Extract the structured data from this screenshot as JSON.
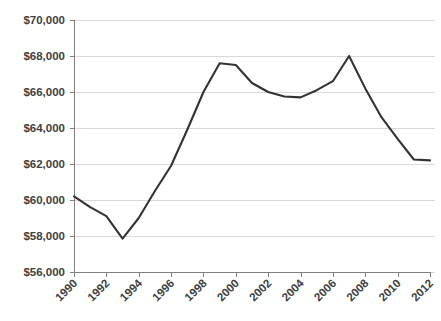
{
  "chart_data": {
    "type": "line",
    "title": "",
    "subtitle": "",
    "xlabel": "",
    "ylabel": "",
    "grid": true,
    "legend": false,
    "legend_position": "none",
    "line_color": "#333333",
    "grid_color": "#d9d9d9",
    "axis_color": "#808080",
    "text_color": "#404040",
    "xlim": [
      1990,
      2012
    ],
    "ylim": [
      56000,
      70000
    ],
    "y_tick_step": 2000,
    "x_tick_step": 2,
    "x_label_rotation": -45,
    "y_tick_labels": [
      "$70,000",
      "$68,000",
      "$66,000",
      "$64,000",
      "$62,000",
      "$60,000",
      "$58,000",
      "$56,000"
    ],
    "y_tick_values": [
      70000,
      68000,
      66000,
      64000,
      62000,
      60000,
      58000,
      56000
    ],
    "x_tick_labels": [
      "1990",
      "1992",
      "1994",
      "1996",
      "1998",
      "2000",
      "2002",
      "2004",
      "2006",
      "2008",
      "2010",
      "2012"
    ],
    "x_tick_values": [
      1990,
      1992,
      1994,
      1996,
      1998,
      2000,
      2002,
      2004,
      2006,
      2008,
      2010,
      2012
    ],
    "x": [
      1990,
      1991,
      1992,
      1993,
      1994,
      1995,
      1996,
      1997,
      1998,
      1999,
      2000,
      2001,
      2002,
      2003,
      2004,
      2005,
      2006,
      2007,
      2008,
      2009,
      2010,
      2011,
      2012
    ],
    "values": [
      60200,
      59600,
      59100,
      57850,
      59000,
      60500,
      61900,
      63900,
      66000,
      67600,
      67500,
      66500,
      66000,
      65750,
      65700,
      66100,
      66600,
      68000,
      66200,
      64600,
      63400,
      62250,
      62200
    ],
    "series": [
      {
        "name": "Median household income",
        "color": "#333333",
        "values": [
          60200,
          59600,
          59100,
          57850,
          59000,
          60500,
          61900,
          63900,
          66000,
          67600,
          67500,
          66500,
          66000,
          65750,
          65700,
          66100,
          66600,
          68000,
          66200,
          64600,
          63400,
          62250,
          62200
        ]
      }
    ]
  },
  "plot_geometry": {
    "left": 74,
    "right": 430,
    "top": 20,
    "bottom": 272
  }
}
